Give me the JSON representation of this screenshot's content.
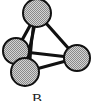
{
  "figure": {
    "label": "B",
    "colors": {
      "stroke": "#111111",
      "fill": "#b8b8b8",
      "background": "#ffffff"
    },
    "nodes": [
      {
        "id": "top",
        "cx": 37,
        "cy": 13,
        "r": 14
      },
      {
        "id": "left",
        "cx": 16,
        "cy": 51,
        "r": 13
      },
      {
        "id": "right",
        "cx": 77,
        "cy": 58,
        "r": 13
      },
      {
        "id": "bottom",
        "cx": 25,
        "cy": 72,
        "r": 14
      }
    ],
    "edges": [
      {
        "from": "top",
        "to": "left"
      },
      {
        "from": "top",
        "to": "bottom"
      },
      {
        "from": "top",
        "to": "right"
      },
      {
        "from": "left",
        "to": "right"
      },
      {
        "from": "bottom",
        "to": "right"
      }
    ]
  }
}
